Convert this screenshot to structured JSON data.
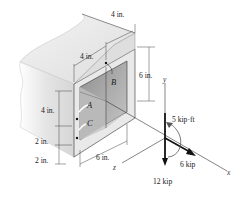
{
  "diagram": {
    "type": "box-beam cross-section with applied loads",
    "points": {
      "A": "A",
      "B": "B",
      "C": "C"
    },
    "dimensions": {
      "top_wall_depth": "4 in.",
      "top_width": "4 in.",
      "right_height": "6 in.",
      "left_height_upper": "4 in.",
      "left_height_mid": "2 in.",
      "left_height_lower": "2 in.",
      "bottom_width": "6 in."
    },
    "axes": {
      "x": "x",
      "y": "y",
      "z": "z"
    },
    "loads": {
      "moment": "5 kip·ft",
      "axial_force": "6 kip",
      "shear_force": "12 kip"
    },
    "colors": {
      "beam_face": "#e6e6e6",
      "beam_side": "#d2d2d2",
      "interior_dark": "#a9a9a9",
      "interior_mid": "#c4c4c4",
      "line": "#222222",
      "background": "#ffffff"
    }
  }
}
